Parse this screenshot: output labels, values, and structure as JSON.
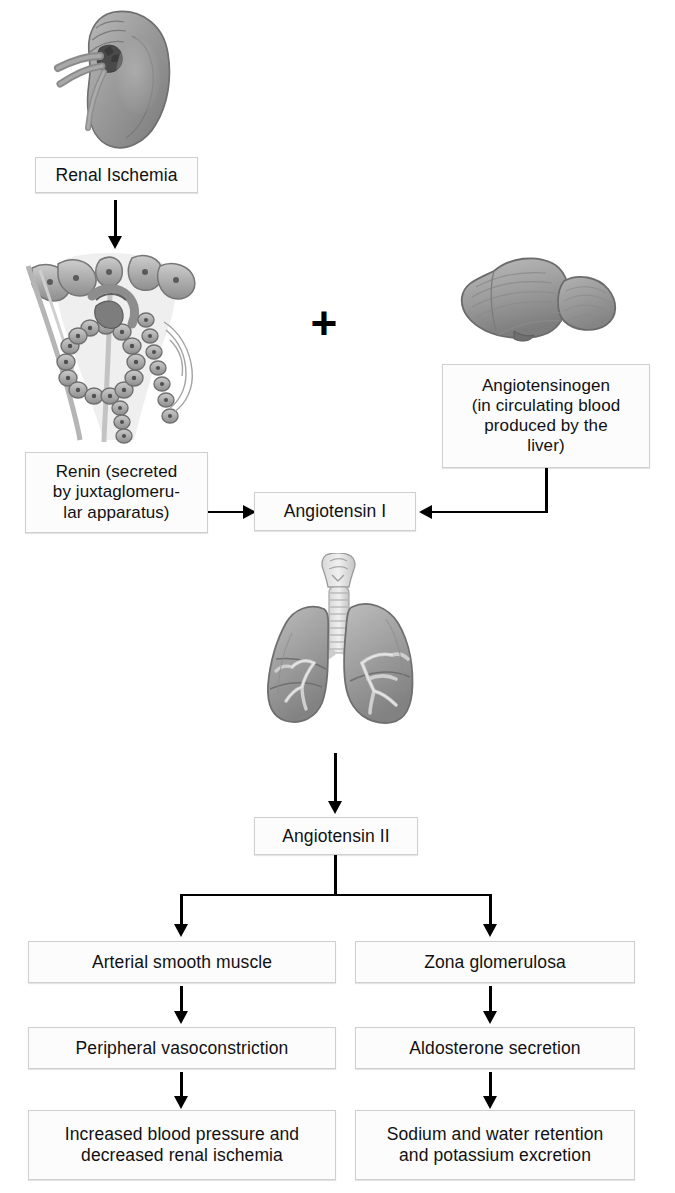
{
  "diagram": {
    "accent_color": "#000000",
    "box_fill": "#fcfcfc",
    "box_border": "#cfcfcf",
    "illustration_color": "#8d8d8d"
  },
  "illustrations": [
    {
      "name": "kidney",
      "label": "kidney"
    },
    {
      "name": "juxtaglomerular-apparatus",
      "label": "juxtaglomerular apparatus"
    },
    {
      "name": "liver",
      "label": "liver"
    },
    {
      "name": "lungs",
      "label": "lungs"
    }
  ],
  "symbols": {
    "plus": "+"
  },
  "nodes": {
    "renal_ischemia": "Renal Ischemia",
    "renin": "Renin (secreted\nby juxtaglomeru-\nlar apparatus)",
    "angiotensinogen": "Angiotensinogen\n(in circulating blood\nproduced by the\nliver)",
    "angiotensin_i": "Angiotensin I",
    "angiotensin_ii": "Angiotensin II",
    "arterial_smooth_muscle": "Arterial smooth muscle",
    "zona_glomerulosa": "Zona glomerulosa",
    "peripheral_vasoconstriction": "Peripheral vasoconstriction",
    "aldosterone_secretion": "Aldosterone secretion",
    "increased_bp": "Increased blood pressure and\ndecreased renal ischemia",
    "sodium_water": "Sodium and water retention\nand potassium excretion"
  }
}
